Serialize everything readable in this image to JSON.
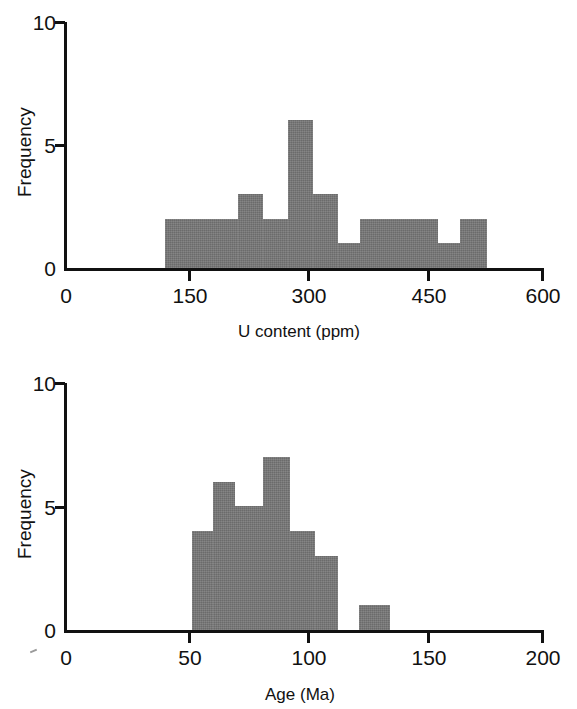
{
  "figure": {
    "title": "",
    "background": "#ffffff",
    "bar_color": "#777777",
    "axis_color": "#111111"
  },
  "panels": [
    {
      "id": "u-content",
      "ylabel": "Frequency",
      "xlabel": "U content (ppm)",
      "annotation": "",
      "y_ticks": [
        "0",
        "5",
        "10"
      ],
      "x_ticks": [
        "0",
        "150",
        "300",
        "450",
        "600"
      ]
    },
    {
      "id": "age",
      "ylabel": "Frequency",
      "xlabel": "Age (Ma)",
      "annotation": "FT Age: 77.9 ± 6.1 Ma",
      "y_ticks": [
        "0",
        "5",
        "10"
      ],
      "x_ticks": [
        "0",
        "50",
        "100",
        "150",
        "200"
      ]
    }
  ],
  "chart_data": [
    {
      "type": "bar",
      "title": "",
      "subtitle": "",
      "xlabel": "U content (ppm)",
      "ylabel": "Frequency",
      "xlim": [
        0,
        600
      ],
      "ylim": [
        0,
        10
      ],
      "xticks": [
        0,
        150,
        300,
        450,
        600
      ],
      "yticks": [
        0,
        5,
        10
      ],
      "grid": false,
      "legend": null,
      "bin_width": 25,
      "bin_edges": [
        125,
        150,
        175,
        200,
        225,
        250,
        275,
        300,
        325,
        350,
        375,
        400,
        425,
        450,
        475,
        500,
        525,
        530
      ],
      "categories": [
        "125-150",
        "150-175",
        "175-200",
        "200-225",
        "225-250",
        "250-275",
        "275-300",
        "300-325",
        "325-350",
        "350-375",
        "375-400",
        "400-425",
        "425-450",
        "450-475",
        "475-500",
        "500-530"
      ],
      "values": [
        2,
        2,
        2,
        2,
        3,
        2,
        6,
        3,
        1,
        2,
        2,
        2,
        2,
        1,
        2,
        2
      ],
      "bars_px": [
        {
          "x0": 165,
          "x1": 238,
          "h": 2
        },
        {
          "x0": 238,
          "x1": 263,
          "h": 3
        },
        {
          "x0": 263,
          "x1": 288,
          "h": 2
        },
        {
          "x0": 288,
          "x1": 313,
          "h": 6
        },
        {
          "x0": 313,
          "x1": 338,
          "h": 3
        },
        {
          "x0": 338,
          "x1": 360,
          "h": 1
        },
        {
          "x0": 360,
          "x1": 438,
          "h": 2
        },
        {
          "x0": 438,
          "x1": 460,
          "h": 1
        },
        {
          "x0": 460,
          "x1": 487,
          "h": 2
        }
      ]
    },
    {
      "type": "bar",
      "title": "",
      "subtitle": "",
      "xlabel": "Age (Ma)",
      "ylabel": "Frequency",
      "annotation": "FT Age: 77.9 ± 6.1 Ma",
      "xlim": [
        0,
        200
      ],
      "ylim": [
        0,
        10
      ],
      "xticks": [
        0,
        50,
        100,
        150,
        200
      ],
      "yticks": [
        0,
        5,
        10
      ],
      "grid": false,
      "legend": null,
      "bin_width": 10,
      "bin_edges": [
        52,
        61,
        70,
        80,
        91,
        101,
        111,
        121,
        133
      ],
      "categories": [
        "52-61",
        "61-70",
        "70-80",
        "80-91",
        "91-101",
        "101-111",
        "111-121",
        "121-133"
      ],
      "values": [
        4,
        6,
        5,
        7,
        4,
        3,
        0,
        1
      ],
      "bars_px": [
        {
          "x0": 192,
          "x1": 213,
          "h": 4
        },
        {
          "x0": 213,
          "x1": 235,
          "h": 6
        },
        {
          "x0": 235,
          "x1": 263,
          "h": 5
        },
        {
          "x0": 263,
          "x1": 290,
          "h": 7
        },
        {
          "x0": 290,
          "x1": 315,
          "h": 4
        },
        {
          "x0": 315,
          "x1": 338,
          "h": 3
        },
        {
          "x0": 359,
          "x1": 390,
          "h": 1
        }
      ]
    }
  ]
}
